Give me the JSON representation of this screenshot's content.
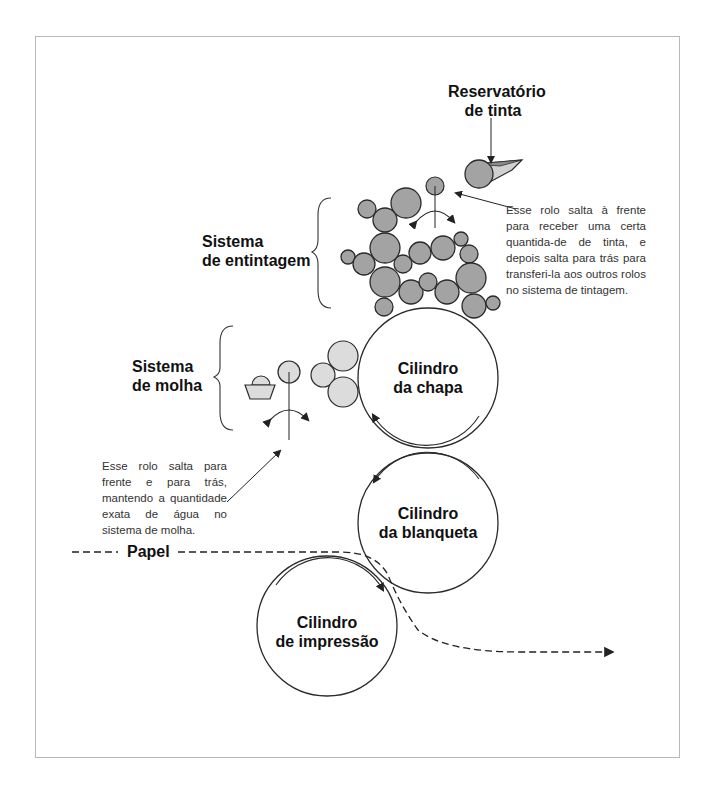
{
  "diagram": {
    "labels": {
      "ink_reservoir": [
        "Reservatório",
        "de tinta"
      ],
      "inking_system": [
        "Sistema",
        "de entintagem"
      ],
      "dampening_system": [
        "Sistema",
        "de molha"
      ],
      "plate_cylinder": [
        "Cilindro",
        "da chapa"
      ],
      "blanket_cylinder": [
        "Cilindro",
        "da blanqueta"
      ],
      "impression_cylinder": [
        "Cilindro",
        "de impressão"
      ],
      "paper": "Papel"
    },
    "notes": {
      "ink_ductor": "Esse rolo salta à frente para receber uma certa quantida-de de tinta, e depois salta para trás para transferi-la aos outros rolos no sistema de tintagem.",
      "water_ductor": "Esse rolo salta para frente e para trás, mantendo a quantidade exata de água no sistema de molha."
    },
    "colors": {
      "ink_roller": "#a3a3a3",
      "water_roller": "#dcdcdc",
      "outline": "#2a2a2a",
      "frame": "#b8b8b8"
    }
  }
}
